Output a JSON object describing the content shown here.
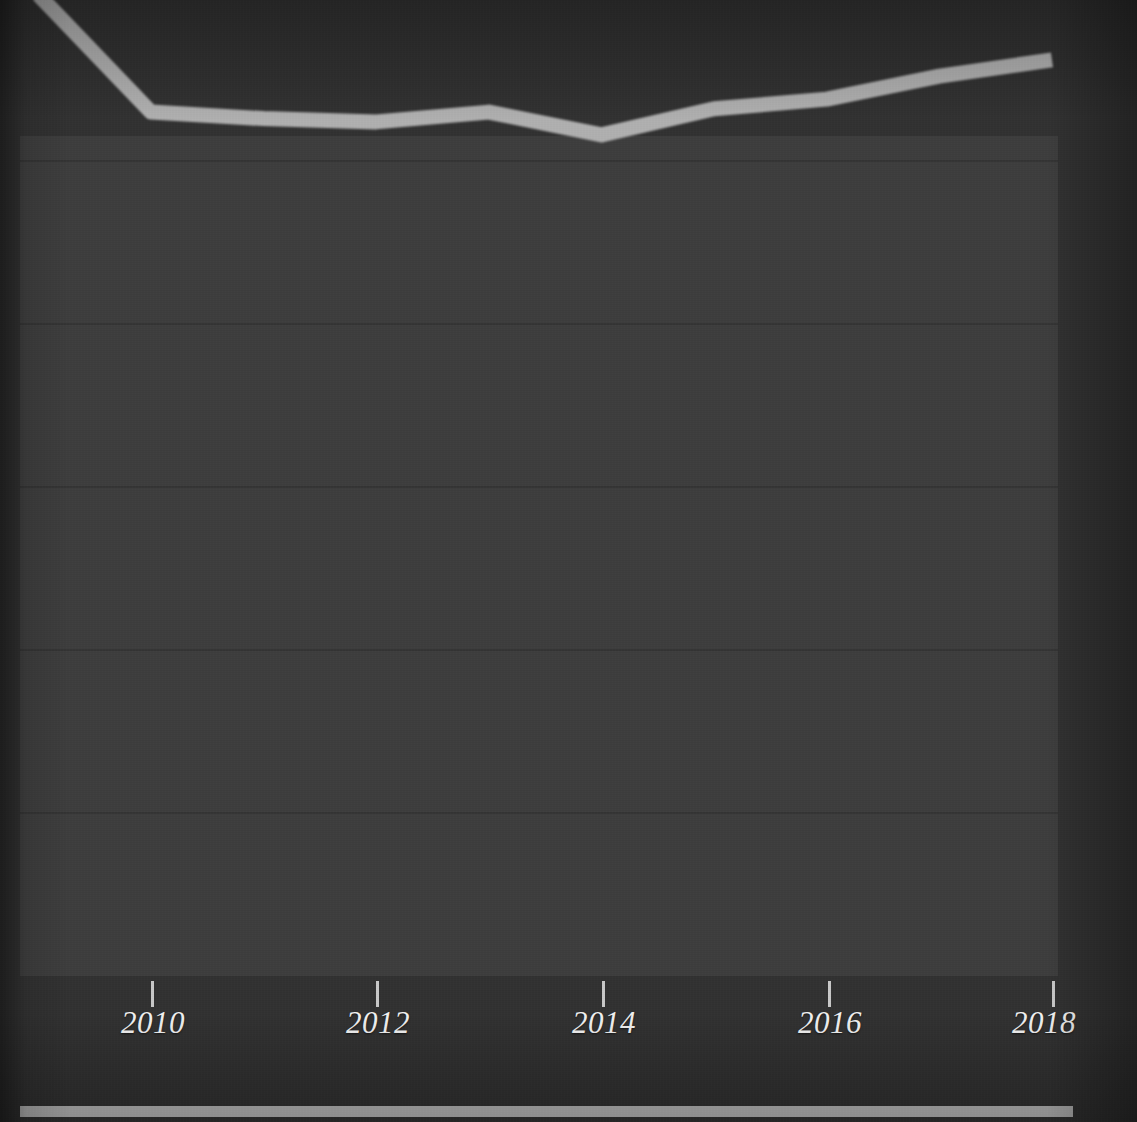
{
  "figure": {
    "background_color": "#313131",
    "plot_background_color": "#3d3d3d",
    "gridline_color": "#333333",
    "axis_color": "#b9b9b9",
    "tick_label_color": "#f2f2f2",
    "series_color": "#b0b0b0"
  },
  "chart_data": {
    "type": "line",
    "title": "",
    "subtitle": "",
    "xlabel": "",
    "ylabel": "",
    "grid": true,
    "grid_axis": "y",
    "legend": false,
    "legend_position": "none",
    "xlim": [
      2008.78,
      2018.0
    ],
    "ylim": [
      0,
      5
    ],
    "xticks": [
      2010,
      2012,
      2014,
      2016,
      2018
    ],
    "xtick_labels": [
      "2010",
      "2012",
      "2014",
      "2016",
      "2018"
    ],
    "yticks": [],
    "ytick_labels": [],
    "x": [
      2009,
      2010,
      2011,
      2012,
      2013,
      2014,
      2015,
      2016,
      2017,
      2018
    ],
    "series": [
      {
        "name": "series-1",
        "color": "#b0b0b0",
        "values": [
          3.01,
          2.65,
          2.63,
          2.62,
          2.65,
          2.58,
          2.66,
          2.69,
          2.76,
          2.81
        ]
      }
    ],
    "annotations": []
  },
  "axes": {
    "x_axis_name": "x-axis",
    "y_axis_name": "y-axis"
  }
}
